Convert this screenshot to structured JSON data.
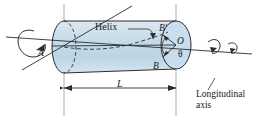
{
  "figure": {
    "background_color": "#ffffff",
    "cylinder_fill": "#cfe0ec",
    "cylinder_edge": "#2d2d2d",
    "line_color": "#2d2d2d",
    "reference_line_color": "#9aa4ab"
  },
  "labels": {
    "point_a": "A",
    "point_b": "B",
    "point_b_prime": "B′",
    "point_o": "O",
    "angle_theta": "θ",
    "helix": "Helix",
    "length": "L",
    "longitudinal_axis_line1": "Longitudinal",
    "longitudinal_axis_line2": "axis"
  },
  "geometry": {
    "left_end_center_x": 64,
    "left_end_center_y": 47,
    "right_end_center_x": 176,
    "right_end_center_y": 45,
    "left_radius_x": 12,
    "left_radius_y": 26,
    "right_radius_x": 15,
    "right_radius_y": 24,
    "dimension_line_y": 88,
    "dimension_start_x": 64,
    "dimension_end_x": 176,
    "vertical_ref_left_x": 64,
    "vertical_ref_right_x": 176
  },
  "annotations": {
    "torque_left": "applied torque arrow at end A",
    "torque_right": "applied torque arrow at end O",
    "dimension_label": "L",
    "leader_helix": "leader line from Helix label to helix curve"
  }
}
